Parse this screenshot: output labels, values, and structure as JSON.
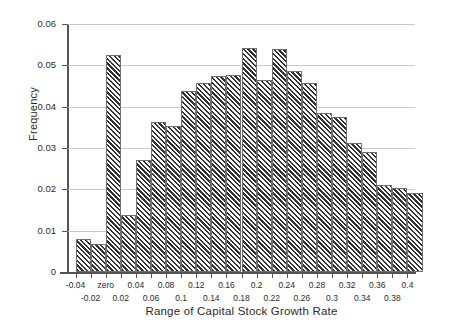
{
  "chart_data": {
    "type": "bar",
    "title": "",
    "subtitle": "",
    "xlabel": "Range of Capital Stock Growth Rate",
    "ylabel": "Frequency",
    "xlim": [
      -0.05,
      0.41
    ],
    "ylim": [
      0,
      0.06
    ],
    "grid": true,
    "legend": null,
    "bin_width": 0.02,
    "y_ticks": [
      "0",
      "0.01",
      "0.02",
      "0.03",
      "0.04",
      "0.05",
      "0.06"
    ],
    "y_tick_values": [
      0,
      0.01,
      0.02,
      0.03,
      0.04,
      0.05,
      0.06
    ],
    "x_ticks_row1": [
      "-0.04",
      "zero",
      "0.04",
      "0.08",
      "0.12",
      "0.16",
      "0.2",
      "0.24",
      "0.28",
      "0.32",
      "0.36",
      "0.4"
    ],
    "x_tick_row1_values": [
      -0.04,
      0,
      0.04,
      0.08,
      0.12,
      0.16,
      0.2,
      0.24,
      0.28,
      0.32,
      0.36,
      0.4
    ],
    "x_ticks_row2": [
      "-0.02",
      "0.02",
      "0.06",
      "0.1",
      "0.14",
      "0.18",
      "0.22",
      "0.26",
      "0.3",
      "0.34",
      "0.38"
    ],
    "x_tick_row2_values": [
      -0.02,
      0.02,
      0.06,
      0.1,
      0.14,
      0.18,
      0.22,
      0.26,
      0.3,
      0.34,
      0.38
    ],
    "categories": [
      "-0.04",
      "-0.02",
      "zero",
      "0.02",
      "0.04",
      "0.06",
      "0.08",
      "0.1",
      "0.12",
      "0.14",
      "0.16",
      "0.18",
      "0.2",
      "0.22",
      "0.24",
      "0.26",
      "0.28",
      "0.3",
      "0.32",
      "0.34",
      "0.36",
      "0.38",
      "0.4"
    ],
    "values": [
      0.008,
      0.0068,
      0.0525,
      0.0137,
      0.027,
      0.0362,
      0.0353,
      0.0437,
      0.0458,
      0.0475,
      0.0476,
      0.0542,
      0.0464,
      0.054,
      0.0486,
      0.0458,
      0.0384,
      0.0374,
      0.0313,
      0.029,
      0.0211,
      0.0203,
      0.019
    ],
    "bar_fill": "#ffffff",
    "bar_hatch": "diagonal-forward-slash",
    "bar_hatch_color": "#333333",
    "bar_edge_color": "#6f6f6f",
    "grid_color": "#c9c9c9",
    "axis_color": "#555555"
  }
}
